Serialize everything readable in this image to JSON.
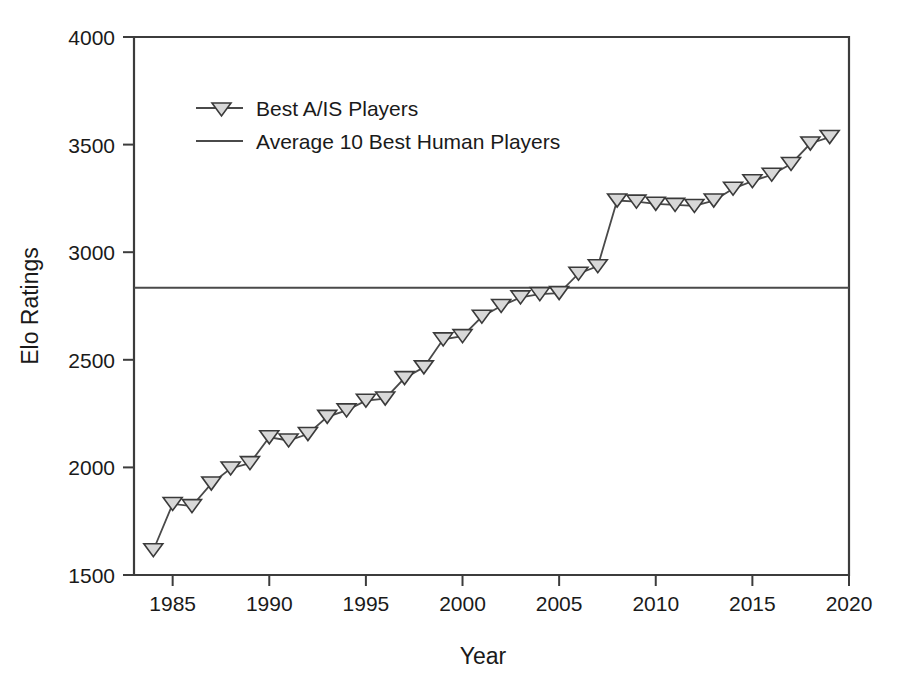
{
  "chart_data": {
    "type": "line",
    "title": "",
    "xlabel": "Year",
    "ylabel": "Elo Ratings",
    "xlim": [
      1983,
      2020
    ],
    "ylim": [
      1500,
      4000
    ],
    "xticks": [
      1985,
      1990,
      1995,
      2000,
      2005,
      2010,
      2015,
      2020
    ],
    "xtick_labels": [
      "1985",
      "1990",
      "1995",
      "2000",
      "2005",
      "2010",
      "2015",
      "2020"
    ],
    "yticks": [
      1500,
      2000,
      2500,
      3000,
      3500,
      4000
    ],
    "ytick_labels": [
      "1500",
      "2000",
      "2500",
      "3000",
      "3500",
      "4000"
    ],
    "grid": false,
    "legend_position": "upper left",
    "series": [
      {
        "name": "Best A/IS Players",
        "marker": "triangle-down",
        "marker_fill": "#d8d8d8",
        "marker_edge": "#3a3a3a",
        "line_color": "#4a4a4a",
        "x": [
          1984,
          1985,
          1986,
          1987,
          1988,
          1989,
          1990,
          1991,
          1992,
          1993,
          1994,
          1995,
          1996,
          1997,
          1998,
          1999,
          2000,
          2001,
          2002,
          2003,
          2004,
          2005,
          2006,
          2007,
          2008,
          2009,
          2010,
          2011,
          2012,
          2013,
          2014,
          2015,
          2016,
          2017,
          2018,
          2019
        ],
        "values": [
          1615,
          1830,
          1820,
          1925,
          1995,
          2020,
          2140,
          2125,
          2155,
          2235,
          2265,
          2310,
          2320,
          2415,
          2465,
          2595,
          2610,
          2700,
          2750,
          2790,
          2805,
          2810,
          2900,
          2935,
          3240,
          3235,
          3225,
          3220,
          3215,
          3240,
          3295,
          3330,
          3360,
          3410,
          3505,
          3535
        ]
      },
      {
        "name": "Average 10 Best Human Players",
        "marker": "none",
        "line_color": "#4a4a4a",
        "type": "horizontal-reference",
        "value": 2835
      }
    ],
    "annotations": []
  },
  "legend": {
    "entries": [
      {
        "label": "Best A/IS Players",
        "has_marker": true
      },
      {
        "label": "Average 10 Best Human Players",
        "has_marker": false
      }
    ]
  },
  "colors": {
    "axis": "#3c3c3c",
    "line": "#4a4a4a",
    "marker_fill": "#d8d8d8",
    "marker_edge": "#3a3a3a",
    "background": "#ffffff",
    "text": "#1a1a1a"
  }
}
